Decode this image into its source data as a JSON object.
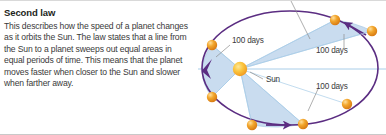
{
  "article": {
    "heading": "Second law",
    "body": "This describes how the speed of a planet changes as it orbits the Sun. The law states that a line from the Sun to a planet sweeps out equal areas in equal periods of time. This means that the planet moves faster when closer to the Sun and slower when farther away."
  },
  "diagram": {
    "name": "keplers-second-law-orbit-diagram",
    "sun_label": "Sun",
    "sector_labels": [
      {
        "id": "upper-left",
        "text": "100 days"
      },
      {
        "id": "right",
        "text": "100 days"
      },
      {
        "id": "lower-right",
        "text": "100 days"
      }
    ],
    "colors": {
      "orbit": "#5b2d82",
      "sector_fill": "#c8dcf0",
      "sector_edge": "#8fb8dd",
      "sun": "#f5a623",
      "sun_core": "#fbd24a",
      "planet": "#e8861e",
      "planet_highlight": "#ffd27f",
      "axis": "#a8cde8",
      "leader": "#8c8c8c",
      "text": "#3a3a3a"
    },
    "orbit": {
      "cx": 100,
      "cy": 67,
      "rx": 88,
      "ry": 57
    },
    "sun": {
      "x": 50,
      "y": 68,
      "r": 7
    },
    "planets": [
      {
        "id": "p1",
        "x": 22,
        "y": 44
      },
      {
        "id": "p2",
        "x": 22,
        "y": 96
      },
      {
        "id": "p3",
        "x": 62,
        "y": 124
      },
      {
        "id": "p4",
        "x": 113,
        "y": 123
      },
      {
        "id": "p5",
        "x": 157,
        "y": 103
      },
      {
        "id": "p6",
        "x": 145,
        "y": 19
      },
      {
        "id": "p7",
        "x": 182,
        "y": 30
      }
    ],
    "direction_arrows": [
      {
        "id": "left-vertex-arrow"
      },
      {
        "id": "bottom-arrow"
      },
      {
        "id": "upper-right-arrow"
      }
    ]
  }
}
